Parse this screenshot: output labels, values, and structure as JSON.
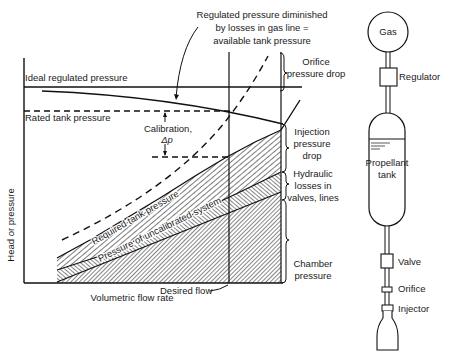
{
  "chart": {
    "x_axis_label": "Volumetric flow rate",
    "y_axis_label": "Head or pressure",
    "lines": {
      "ideal_regulated": "Ideal regulated pressure",
      "rated_tank": "Rated tank pressure",
      "required_tank": "Required tank pressure",
      "uncalibrated": "Pressure of uncalibrated system",
      "desired_flow": "Desired flow"
    },
    "annotations": {
      "regulated_line1": "Regulated pressure diminished",
      "regulated_line2": "by losses in gas line =",
      "regulated_line3": "available tank pressure",
      "calibration_line1": "Calibration,",
      "calibration_line2": "Δp"
    },
    "brackets": {
      "orifice_line1": "Orifice",
      "orifice_line2": "pressure drop",
      "injection_line1": "Injection",
      "injection_line2": "pressure",
      "injection_line3": "drop",
      "hydraulic_line1": "Hydraulic",
      "hydraulic_line2": "losses in",
      "hydraulic_line3": "valves, lines",
      "chamber_line1": "Chamber",
      "chamber_line2": "pressure"
    }
  },
  "schematic": {
    "gas": "Gas",
    "regulator": "Regulator",
    "tank_line1": "Propellant",
    "tank_line2": "tank",
    "valve": "Valve",
    "orifice": "Orifice",
    "injector": "Injector"
  }
}
